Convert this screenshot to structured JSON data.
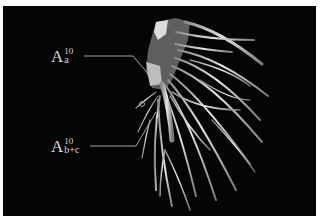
{
  "figure": {
    "background_color": "#050505",
    "vessel_color": "#cfcfcf",
    "labels": [
      {
        "base": "A",
        "sup": "10",
        "sub": "a"
      },
      {
        "base": "A",
        "sup": "10",
        "sub": "b+c"
      }
    ]
  }
}
